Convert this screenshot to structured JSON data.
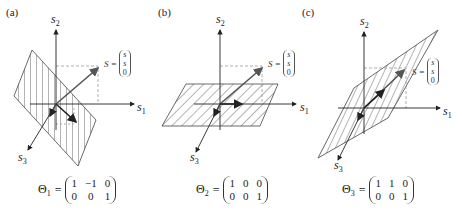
{
  "figure": {
    "panels": [
      {
        "id": "a",
        "label": "(a)",
        "axes": {
          "s1": "s",
          "s1_sub": "1",
          "s2": "s",
          "s2_sub": "2",
          "s3": "s",
          "s3_sub": "3"
        },
        "vector": {
          "name": "S",
          "eq": "=",
          "components": [
            "s",
            "s",
            "0"
          ]
        },
        "equation": {
          "symbol": "Θ",
          "sub": "1",
          "eq": "=",
          "matrix": [
            [
              "1",
              "−1",
              "0"
            ],
            [
              "0",
              "0",
              "1"
            ]
          ]
        },
        "plane": "vertical-hatched parallelogram"
      },
      {
        "id": "b",
        "label": "(b)",
        "axes": {
          "s1": "s",
          "s1_sub": "1",
          "s2": "s",
          "s2_sub": "2",
          "s3": "s",
          "s3_sub": "3"
        },
        "vector": {
          "name": "S",
          "eq": "=",
          "components": [
            "s",
            "s",
            "0"
          ]
        },
        "equation": {
          "symbol": "Θ",
          "sub": "2",
          "eq": "=",
          "matrix": [
            [
              "1",
              "0",
              "0"
            ],
            [
              "0",
              "0",
              "1"
            ]
          ]
        },
        "plane": "horizontal-hatched parallelogram"
      },
      {
        "id": "c",
        "label": "(c)",
        "axes": {
          "s1": "s",
          "s1_sub": "1",
          "s2": "s",
          "s2_sub": "2",
          "s3": "s",
          "s3_sub": "3"
        },
        "vector": {
          "name": "S",
          "eq": "=",
          "components": [
            "s",
            "s",
            "0"
          ]
        },
        "equation": {
          "symbol": "Θ",
          "sub": "3",
          "eq": "=",
          "matrix": [
            [
              "1",
              "1",
              "0"
            ],
            [
              "0",
              "0",
              "1"
            ]
          ]
        },
        "plane": "diagonal-hatched parallelogram"
      }
    ],
    "colors": {
      "axis": "#222222",
      "vector": "#555555",
      "hatch": "#444444",
      "dash": "#999999"
    }
  }
}
